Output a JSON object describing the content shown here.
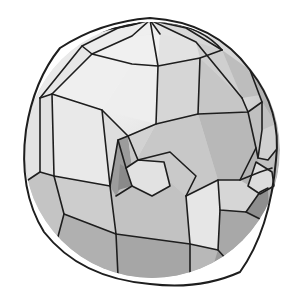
{
  "scene": {
    "subject": "Low-poly shaded 3D mesh of a sphere-like head with an eye socket and snout",
    "background": "#ffffff",
    "line_color": "#1e1e1e",
    "sphere": {
      "cx": 152,
      "cy": 150,
      "r": 128
    },
    "faces": [
      {
        "p": "150,20 88,30 60,48 82,46 118,28",
        "f": "#e8e8e8"
      },
      {
        "p": "150,20 118,28 82,46 92,54 132,36",
        "f": "#ececec"
      },
      {
        "p": "150,20 132,36 160,34 158,22",
        "f": "#efefef"
      },
      {
        "p": "150,20 160,34 196,42 186,28",
        "f": "#e4e4e4"
      },
      {
        "p": "150,20 186,28 222,50 196,42",
        "f": "#d8d8d8"
      },
      {
        "p": "60,48 40,90 28,118 40,98 82,46",
        "f": "#eaeaea"
      },
      {
        "p": "82,46 40,98 52,94 92,54",
        "f": "#e6e6e6"
      },
      {
        "p": "92,54 52,94 102,110 132,64",
        "f": "#efefef"
      },
      {
        "p": "132,64 102,110 156,124 158,66",
        "f": "#eeeeee"
      },
      {
        "p": "132,36 92,54 132,64 158,66 160,34",
        "f": "#f0f0f0"
      },
      {
        "p": "160,34 158,66 200,58 196,42",
        "f": "#e2e2e2"
      },
      {
        "p": "196,42 200,58 242,98 222,50",
        "f": "#cfcfcf"
      },
      {
        "p": "158,66 156,124 198,114 200,58",
        "f": "#d6d6d6"
      },
      {
        "p": "200,58 198,114 248,112 242,98",
        "f": "#c6c6c6"
      },
      {
        "p": "222,50 242,98 266,94 250,70",
        "f": "#bdbdbd"
      },
      {
        "p": "250,70 266,94 276,124 262,102",
        "f": "#b2b2b2"
      },
      {
        "p": "28,118 24,150 28,180 40,172 40,98",
        "f": "#e4e4e4"
      },
      {
        "p": "40,98 40,172 54,176 52,94",
        "f": "#e0e0e0"
      },
      {
        "p": "52,94 54,176 110,186 102,110",
        "f": "#e9e9e9"
      },
      {
        "p": "102,110 110,186 118,140 128,136",
        "f": "#dedede"
      },
      {
        "p": "128,136 156,124 132,168 118,140",
        "f": "#d2d2d2"
      },
      {
        "p": "156,124 198,114 218,180 186,196 168,180 132,168",
        "f": "#c8c8c8"
      },
      {
        "p": "198,114 248,112 256,148 240,180 218,180",
        "f": "#b8b8b8"
      },
      {
        "p": "248,112 262,102 276,124 272,168 260,172 256,148",
        "f": "#c0c0c0"
      },
      {
        "p": "262,130 276,124 276,150 268,160 258,158",
        "f": "#d0d0d0"
      },
      {
        "p": "28,180 38,220 56,244 64,214 54,176 40,172",
        "f": "#c4c4c4"
      },
      {
        "p": "54,176 64,214 116,234 110,186",
        "f": "#cdcdcd"
      },
      {
        "p": "110,186 116,234 190,244 186,196 168,180 132,168 118,140",
        "f": "#c2c2c2"
      },
      {
        "p": "186,196 190,244 218,250 220,210 218,180",
        "f": "#e6e6e6"
      },
      {
        "p": "218,180 220,210 246,212 260,192 240,180",
        "f": "#d6d6d6"
      },
      {
        "p": "240,180 260,192 268,188 272,168 260,172 256,148",
        "f": "#b4b4b4"
      },
      {
        "p": "220,210 218,250 236,270 260,262 262,220 246,212",
        "f": "#a8a8a8"
      },
      {
        "p": "262,220 260,262 270,248 268,188 260,192 246,212",
        "f": "#8e8e8e"
      },
      {
        "p": "56,244 80,264 118,276 116,234 64,214",
        "f": "#b0b0b0"
      },
      {
        "p": "116,234 118,276 160,282 190,274 190,244",
        "f": "#a6a6a6"
      },
      {
        "p": "190,244 190,274 212,270 218,250",
        "f": "#b8b8b8"
      },
      {
        "p": "212,270 236,270 218,250",
        "f": "#9a9a9a"
      }
    ],
    "eye_socket": {
      "outer": {
        "p": "128,136 118,140 110,186 116,196 132,168",
        "f": "#9c9c9c"
      },
      "inner_rim": {
        "p": "128,136 132,168 170,180 186,196 196,176 170,152 138,160",
        "f": "#c9c9c9"
      },
      "ball": {
        "p": "138,160 126,168 132,186 152,196 170,186 164,162",
        "f": "#e2e2e2"
      },
      "shadow": {
        "p": "120,164 126,168 132,186 118,190",
        "f": "#8a8a8a"
      }
    },
    "ear": {
      "p": "256,162 272,172 274,186 260,194 248,186",
      "f": "#dcdcdc"
    },
    "edges": [
      "M60,48 Q100,28 150,20 Q200,24 222,50",
      "M88,30 Q120,30 150,20",
      "M150,20 L118,28 L82,46 L40,98",
      "M150,20 L132,36 L92,54 L52,94",
      "M150,20 L158,66 L156,124",
      "M150,20 L160,34",
      "M150,20 L196,42 L242,98",
      "M150,20 L186,28 L222,50",
      "M82,46 L92,54 L132,64 L158,66 L200,58 L222,50",
      "M40,98 L52,94 L102,110 L128,136 L156,124 L198,114 L248,112 L262,102 L250,70",
      "M200,58 L198,114",
      "M242,98 L248,112",
      "M40,98 L40,172 L54,176 L110,186",
      "M52,94 L54,176",
      "M102,110 L110,186 L116,234",
      "M28,180 L40,172",
      "M54,176 L64,214 L56,244",
      "M64,214 L116,234 L190,244 L218,250",
      "M186,196 L190,244 L190,274",
      "M116,234 L118,276",
      "M186,196 L218,180 L240,180 L256,148 L248,112",
      "M218,180 L220,210 L246,212 L260,192 L268,188",
      "M220,210 L218,250 L236,270",
      "M246,212 L262,220 L260,262",
      "M240,180 L260,172 L272,168",
      "M256,148 L258,158 L268,160 L276,150",
      "M262,102 L262,130 L258,158",
      "M128,136 L118,140 L110,186",
      "M128,136 L138,160 L170,152 L196,176 L186,196",
      "M138,160 L126,168 L132,186 L152,196 L170,186 L164,162 L138,160",
      "M118,140 L126,168",
      "M132,186 L116,196",
      "M256,162 L272,172 L274,186 L260,194 L248,186 Z"
    ]
  }
}
